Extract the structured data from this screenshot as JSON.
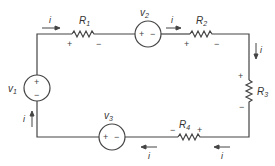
{
  "diagram": {
    "type": "series circuit",
    "colors": {
      "wire": "#444444",
      "text": "#333333",
      "background": "#ffffff"
    },
    "current": {
      "label": "i"
    },
    "sources": [
      {
        "id": "v1",
        "label": "v",
        "sub": "1",
        "plus": "+",
        "minus": "−"
      },
      {
        "id": "v2",
        "label": "v",
        "sub": "2",
        "plus": "+",
        "minus": "−"
      },
      {
        "id": "v3",
        "label": "v",
        "sub": "3",
        "plus": "+",
        "minus": "−"
      }
    ],
    "resistors": [
      {
        "id": "R1",
        "label": "R",
        "sub": "1",
        "plus": "+",
        "minus": "−"
      },
      {
        "id": "R2",
        "label": "R",
        "sub": "2",
        "plus": "+",
        "minus": "−"
      },
      {
        "id": "R3",
        "label": "R",
        "sub": "3",
        "plus": "+",
        "minus": "−"
      },
      {
        "id": "R4",
        "label": "R",
        "sub": "4",
        "plus": "+",
        "minus": "−"
      }
    ]
  }
}
